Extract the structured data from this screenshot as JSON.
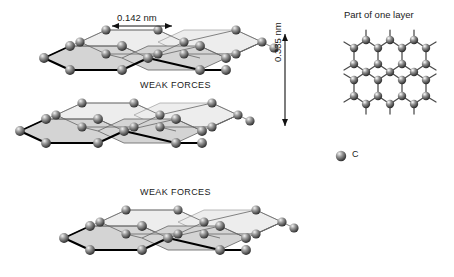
{
  "figure": {
    "background_color": "#ffffff"
  },
  "annotations": {
    "bond_length": "0.142 nm",
    "interlayer_spacing": "0.335 nm",
    "weak_forces_upper": "WEAK FORCES",
    "weak_forces_lower": "WEAK FORCES"
  },
  "side_panel": {
    "title": "Part of one layer"
  },
  "legend": {
    "items": [
      {
        "symbol": "C",
        "marker": "atom-sphere",
        "color": "#3a3a3a"
      }
    ],
    "carbon_label": "C"
  },
  "structure": {
    "layer_count": 3,
    "atom_color_dark": "#2e2e2e",
    "atom_color_light": "#e8e8e8",
    "face_fill": "#d8d8d8",
    "face_fill_light": "#ededed",
    "bond_color": "#555555",
    "edge_bold_color": "#000000"
  },
  "lattice": {
    "hex_columns": 3,
    "hex_rows": 2,
    "bond_color": "#4a4a4a"
  }
}
